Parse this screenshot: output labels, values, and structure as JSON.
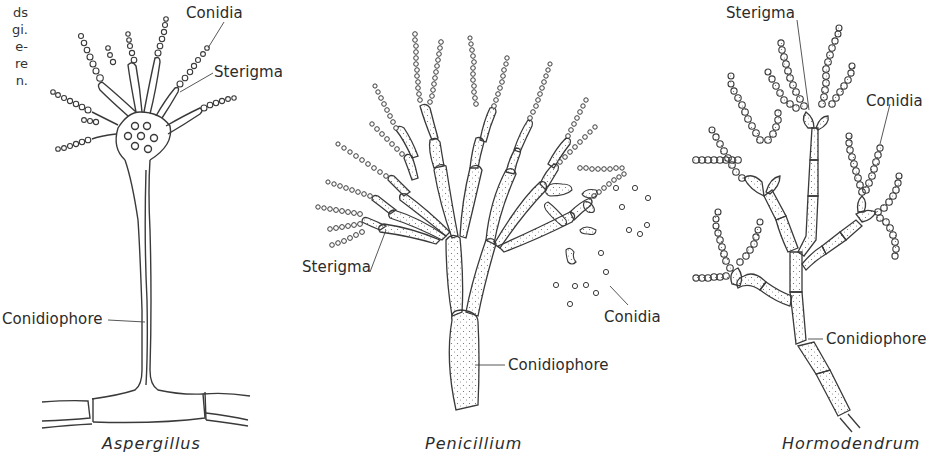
{
  "figure": {
    "left_text_fragments": [
      "ds",
      "gi.",
      "e-",
      "re",
      "n."
    ],
    "panels": [
      {
        "caption": "Aspergillus",
        "labels": {
          "conidia": "Conidia",
          "sterigma": "Sterigma",
          "conidiophore": "Conidiophore"
        }
      },
      {
        "caption": "Penicillium",
        "labels": {
          "sterigma": "Sterigma",
          "conidia": "Conidia",
          "conidiophore": "Conidiophore"
        }
      },
      {
        "caption": "Hormodendrum",
        "labels": {
          "sterigma": "Sterigma",
          "conidia": "Conidia",
          "conidiophore": "Conidiophore"
        }
      }
    ]
  },
  "style": {
    "ink": "#3a3a3a",
    "background": "#ffffff"
  }
}
